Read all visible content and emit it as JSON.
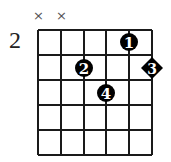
{
  "chord_diagram": {
    "base_fret_label": "2",
    "strings": 6,
    "frets_shown": 5,
    "muted_strings": [
      {
        "string": 1,
        "symbol": "×"
      },
      {
        "string": 2,
        "symbol": "×"
      }
    ],
    "fingers": [
      {
        "finger": "1",
        "string": 5,
        "fret": 1,
        "shape": "circle"
      },
      {
        "finger": "2",
        "string": 3,
        "fret": 2,
        "shape": "circle"
      },
      {
        "finger": "3",
        "string": 6,
        "fret": 2,
        "shape": "diamond"
      },
      {
        "finger": "4",
        "string": 4,
        "fret": 3,
        "shape": "circle"
      }
    ],
    "colors": {
      "grid": "#1a1a1a",
      "marker": "#000000",
      "marker_text": "#ffffff",
      "mute": "#555555"
    }
  }
}
